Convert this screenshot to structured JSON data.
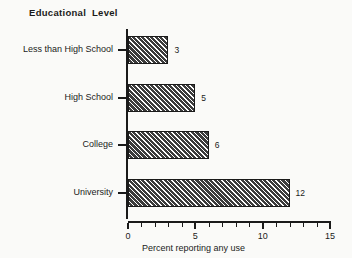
{
  "chart_data": {
    "type": "bar",
    "orientation": "horizontal",
    "title": "Educational  Level",
    "subtitle": "",
    "categories": [
      "Less than High School",
      "High School",
      "College",
      "University"
    ],
    "values": [
      3,
      5,
      6,
      12
    ],
    "data_labels": [
      "3",
      "5",
      "6",
      "12"
    ],
    "xlabel": "Percent reporting any use",
    "ylabel": "Educational  Level",
    "xlim": [
      0,
      15
    ],
    "xticks": [
      0,
      5,
      10,
      15
    ],
    "xtick_labels": [
      "0",
      "5",
      "10",
      "15"
    ],
    "xticks_minor_step": 1,
    "grid": false,
    "legend": false,
    "series_fill": "#3c3c3c",
    "series_hatch": "diagonal-45",
    "axis_color": "#1a1a1a",
    "background": "#fafaf8"
  }
}
